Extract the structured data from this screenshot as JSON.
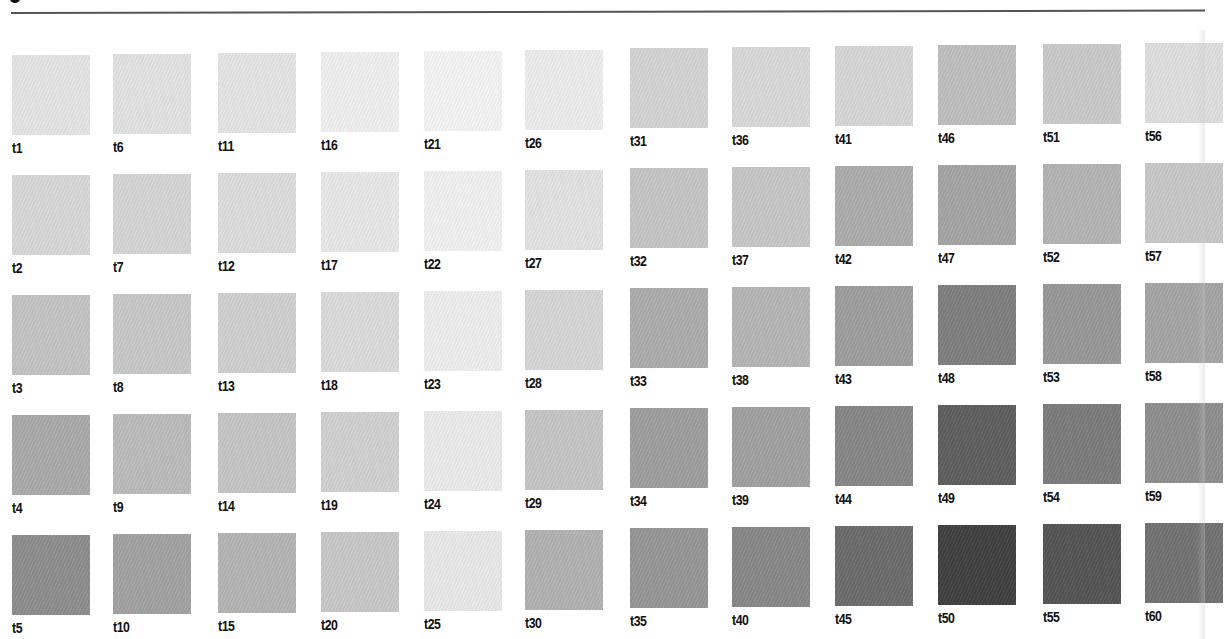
{
  "page": {
    "title": "",
    "swatch_columns": 12,
    "swatch_rows": 5
  },
  "swatches": [
    {
      "label": "t1",
      "color": "#e6e6e6",
      "col": 0,
      "row": 0
    },
    {
      "label": "t2",
      "color": "#d9d9d9",
      "col": 0,
      "row": 1
    },
    {
      "label": "t3",
      "color": "#c4c4c4",
      "col": 0,
      "row": 2
    },
    {
      "label": "t4",
      "color": "#ababab",
      "col": 0,
      "row": 3
    },
    {
      "label": "t5",
      "color": "#8e8e8e",
      "col": 0,
      "row": 4
    },
    {
      "label": "t6",
      "color": "#e3e3e3",
      "col": 1,
      "row": 0
    },
    {
      "label": "t7",
      "color": "#d6d6d6",
      "col": 1,
      "row": 1
    },
    {
      "label": "t8",
      "color": "#c9c9c9",
      "col": 1,
      "row": 2
    },
    {
      "label": "t9",
      "color": "#bcbcbc",
      "col": 1,
      "row": 3
    },
    {
      "label": "t10",
      "color": "#a3a3a3",
      "col": 1,
      "row": 4
    },
    {
      "label": "t11",
      "color": "#e6e6e6",
      "col": 2,
      "row": 0
    },
    {
      "label": "t12",
      "color": "#dedede",
      "col": 2,
      "row": 1
    },
    {
      "label": "t13",
      "color": "#d1d1d1",
      "col": 2,
      "row": 2
    },
    {
      "label": "t14",
      "color": "#c6c6c6",
      "col": 2,
      "row": 3
    },
    {
      "label": "t15",
      "color": "#b5b5b5",
      "col": 2,
      "row": 4
    },
    {
      "label": "t16",
      "color": "#f1f1f1",
      "col": 3,
      "row": 0
    },
    {
      "label": "t17",
      "color": "#e9e9e9",
      "col": 3,
      "row": 1
    },
    {
      "label": "t18",
      "color": "#dcdcdc",
      "col": 3,
      "row": 2
    },
    {
      "label": "t19",
      "color": "#d2d2d2",
      "col": 3,
      "row": 3
    },
    {
      "label": "t20",
      "color": "#c9c9c9",
      "col": 3,
      "row": 4
    },
    {
      "label": "t21",
      "color": "#f5f5f5",
      "col": 4,
      "row": 0
    },
    {
      "label": "t22",
      "color": "#f2f2f2",
      "col": 4,
      "row": 1
    },
    {
      "label": "t23",
      "color": "#efefef",
      "col": 4,
      "row": 2
    },
    {
      "label": "t24",
      "color": "#ececec",
      "col": 4,
      "row": 3
    },
    {
      "label": "t25",
      "color": "#eaeaea",
      "col": 4,
      "row": 4
    },
    {
      "label": "t26",
      "color": "#eeeeee",
      "col": 5,
      "row": 0
    },
    {
      "label": "t27",
      "color": "#e3e3e3",
      "col": 5,
      "row": 1
    },
    {
      "label": "t28",
      "color": "#d7d7d7",
      "col": 5,
      "row": 2
    },
    {
      "label": "t29",
      "color": "#c6c6c6",
      "col": 5,
      "row": 3
    },
    {
      "label": "t30",
      "color": "#b3b3b3",
      "col": 5,
      "row": 4
    },
    {
      "label": "t31",
      "color": "#d5d5d5",
      "col": 6,
      "row": 0
    },
    {
      "label": "t32",
      "color": "#c6c6c6",
      "col": 6,
      "row": 1
    },
    {
      "label": "t33",
      "color": "#adadad",
      "col": 6,
      "row": 2
    },
    {
      "label": "t34",
      "color": "#9f9f9f",
      "col": 6,
      "row": 3
    },
    {
      "label": "t35",
      "color": "#979797",
      "col": 6,
      "row": 4
    },
    {
      "label": "t36",
      "color": "#dadada",
      "col": 7,
      "row": 0
    },
    {
      "label": "t37",
      "color": "#c8c8c8",
      "col": 7,
      "row": 1
    },
    {
      "label": "t38",
      "color": "#b6b6b6",
      "col": 7,
      "row": 2
    },
    {
      "label": "t39",
      "color": "#a1a1a1",
      "col": 7,
      "row": 3
    },
    {
      "label": "t40",
      "color": "#888888",
      "col": 7,
      "row": 4
    },
    {
      "label": "t41",
      "color": "#d8d8d8",
      "col": 8,
      "row": 0
    },
    {
      "label": "t42",
      "color": "#adadad",
      "col": 8,
      "row": 1
    },
    {
      "label": "t43",
      "color": "#9e9e9e",
      "col": 8,
      "row": 2
    },
    {
      "label": "t44",
      "color": "#878787",
      "col": 8,
      "row": 3
    },
    {
      "label": "t45",
      "color": "#6d6d6d",
      "col": 8,
      "row": 4
    },
    {
      "label": "t46",
      "color": "#c0c0c0",
      "col": 9,
      "row": 0
    },
    {
      "label": "t47",
      "color": "#a6a6a6",
      "col": 9,
      "row": 1
    },
    {
      "label": "t48",
      "color": "#808080",
      "col": 9,
      "row": 2
    },
    {
      "label": "t49",
      "color": "#5f5f5f",
      "col": 9,
      "row": 3
    },
    {
      "label": "t50",
      "color": "#404040",
      "col": 9,
      "row": 4
    },
    {
      "label": "t51",
      "color": "#cbcbcb",
      "col": 10,
      "row": 0
    },
    {
      "label": "t52",
      "color": "#b5b5b5",
      "col": 10,
      "row": 1
    },
    {
      "label": "t53",
      "color": "#999999",
      "col": 10,
      "row": 2
    },
    {
      "label": "t54",
      "color": "#7d7d7d",
      "col": 10,
      "row": 3
    },
    {
      "label": "t55",
      "color": "#555555",
      "col": 10,
      "row": 4
    },
    {
      "label": "t56",
      "color": "#e0e0e0",
      "col": 11,
      "row": 0
    },
    {
      "label": "t57",
      "color": "#c9c9c9",
      "col": 11,
      "row": 1
    },
    {
      "label": "t58",
      "color": "#a6a6a6",
      "col": 11,
      "row": 2
    },
    {
      "label": "t59",
      "color": "#8f8f8f",
      "col": 11,
      "row": 3
    },
    {
      "label": "t60",
      "color": "#737373",
      "col": 11,
      "row": 4
    }
  ],
  "layout": {
    "col_x": [
      12,
      113,
      218,
      321,
      424,
      525,
      630,
      732,
      835,
      938,
      1043,
      1145
    ],
    "row_y": [
      55,
      175,
      295,
      415,
      535
    ],
    "col_y_offset": [
      0,
      -1,
      -2,
      -3,
      -4,
      -5,
      -7,
      -8,
      -9,
      -10,
      -11,
      -12
    ]
  }
}
